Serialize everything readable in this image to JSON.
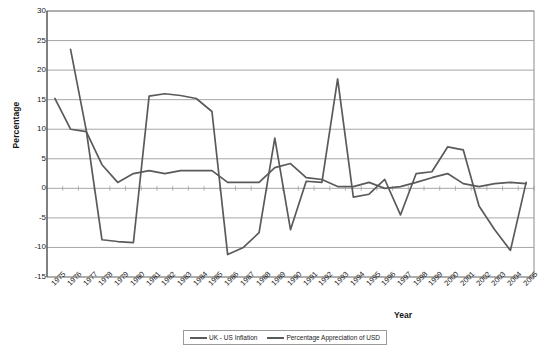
{
  "chart_data": {
    "type": "line",
    "title": "",
    "xlabel": "Year",
    "ylabel": "Percentage",
    "ylim": [
      -15,
      30
    ],
    "yticks": [
      30,
      25,
      20,
      15,
      10,
      5,
      0,
      -5,
      -10,
      -15
    ],
    "grid": true,
    "legend_position": "bottom",
    "categories": [
      "1975",
      "1976",
      "1977",
      "1978",
      "1979",
      "1980",
      "1981",
      "1982",
      "1983",
      "1984",
      "1985",
      "1986",
      "1987",
      "1988",
      "1989",
      "1990",
      "1991",
      "1992",
      "1993",
      "1994",
      "1995",
      "1996",
      "1997",
      "1998",
      "1999",
      "2000",
      "2001",
      "2002",
      "2003",
      "2004",
      "2005"
    ],
    "series": [
      {
        "name": "UK - US Inflation",
        "color": "#5a5a5a",
        "values": [
          15.2,
          10.0,
          9.6,
          4.0,
          1.0,
          2.5,
          3.0,
          2.5,
          3.0,
          3.0,
          3.0,
          1.0,
          1.0,
          1.0,
          3.5,
          4.2,
          1.8,
          1.5,
          0.3,
          0.3,
          1.0,
          0.0,
          0.3,
          1.0,
          1.8,
          2.5,
          0.8,
          0.3,
          0.8,
          1.0,
          0.8
        ]
      },
      {
        "name": "Percentage Appreciation of USD",
        "color": "#5a5a5a",
        "values": [
          null,
          23.5,
          9.8,
          -8.7,
          -9.0,
          -9.2,
          15.6,
          16.0,
          15.7,
          15.2,
          13.0,
          -11.2,
          -10.0,
          -7.5,
          8.5,
          -7.0,
          1.2,
          1.0,
          18.5,
          -1.5,
          -1.0,
          1.5,
          -4.5,
          2.5,
          2.8,
          7.0,
          6.5,
          -3.0,
          -7.0,
          -10.5,
          1.0
        ]
      }
    ]
  },
  "axes": {
    "y_title": "Percentage",
    "x_title": "Year"
  },
  "legend": {
    "items": [
      {
        "label": "UK - US Inflation",
        "color": "#5a5a5a"
      },
      {
        "label": "Percentage Appreciation of USD",
        "color": "#5a5a5a"
      }
    ]
  },
  "style": {
    "plot_bg": "#ffffff",
    "grid_color": "#8f8f8f",
    "frame_color": "#8a8a8a",
    "line_color": "#5a5a5a"
  }
}
